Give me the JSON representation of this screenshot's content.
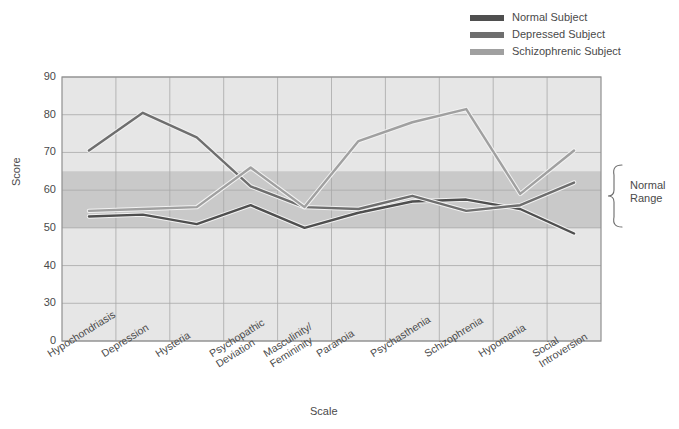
{
  "chart_data": {
    "type": "line",
    "title": "",
    "xlabel": "Scale",
    "ylabel": "Score",
    "ylim": [
      0,
      90
    ],
    "yticks": [
      0,
      30,
      40,
      50,
      60,
      70,
      80,
      90
    ],
    "grid": true,
    "legend_position": "top-right",
    "categories": [
      "Hypochondriasis",
      "Depression",
      "Hysteria",
      "Psychopathic Deviation",
      "Masculinity/ Femininity",
      "Paranoia",
      "Psychasthenia",
      "Schizophrenia",
      "Hypomania",
      "Social Introversion"
    ],
    "series": [
      {
        "name": "Normal Subject",
        "color": "#4f4f4f",
        "values": [
          53,
          53.5,
          51,
          56,
          50,
          54,
          57,
          57.5,
          55,
          48.5
        ]
      },
      {
        "name": "Depressed Subject",
        "color": "#6e6e6e",
        "values": [
          70.5,
          80.5,
          74,
          61,
          55.5,
          55,
          58.5,
          54.5,
          56,
          62
        ]
      },
      {
        "name": "Schizophrenic Subject",
        "color": "#a0a0a0",
        "values": [
          54.5,
          55,
          55.5,
          66,
          55.5,
          73,
          78,
          81.5,
          59,
          70.5
        ]
      }
    ],
    "shaded_band": {
      "label": "Normal Range",
      "from": 50,
      "to": 65,
      "color": "#c9c9c9"
    },
    "plot_background": "#e6e6e6"
  },
  "legend": {
    "items": [
      {
        "label": "Normal Subject"
      },
      {
        "label": "Depressed Subject"
      },
      {
        "label": "Schizophrenic Subject"
      }
    ]
  },
  "annotation": {
    "normal_range_line1": "Normal",
    "normal_range_line2": "Range"
  },
  "axes": {
    "y_title": "Score",
    "x_title": "Scale",
    "y_ticks": [
      "90",
      "80",
      "70",
      "60",
      "50",
      "40",
      "30",
      "0"
    ]
  }
}
